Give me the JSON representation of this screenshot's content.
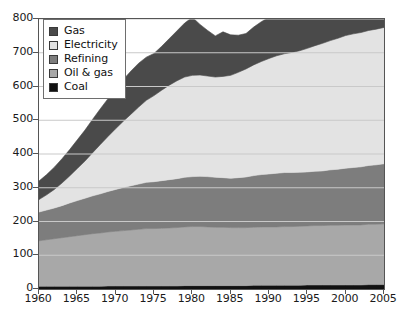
{
  "chart": {
    "type": "area",
    "title": "",
    "legend_position": "top-left",
    "grid": true
  },
  "axes": {
    "x": {
      "label": "",
      "min": 1960,
      "max": 2005,
      "tick_labels": [
        "1960",
        "1965",
        "1970",
        "1975",
        "1980",
        "1985",
        "1990",
        "1995",
        "2000",
        "2005"
      ],
      "tick_values": [
        1960,
        1965,
        1970,
        1975,
        1980,
        1985,
        1990,
        1995,
        2000,
        2005
      ]
    },
    "y": {
      "label": "",
      "min": 0,
      "max": 800,
      "tick_labels": [
        "0",
        "100",
        "200",
        "300",
        "400",
        "500",
        "600",
        "700",
        "800"
      ],
      "tick_values": [
        0,
        100,
        200,
        300,
        400,
        500,
        600,
        700,
        800
      ]
    }
  },
  "legend": {
    "items": [
      {
        "label": "Gas",
        "color": "#4a4a4a"
      },
      {
        "label": "Electricity",
        "color": "#e3e3e3"
      },
      {
        "label": "Refining",
        "color": "#7d7d7d"
      },
      {
        "label": "Oil & gas",
        "color": "#a8a8a8"
      },
      {
        "label": "Coal",
        "color": "#111111"
      }
    ]
  },
  "chart_data": {
    "type": "area",
    "stacked": true,
    "title": "",
    "xlabel": "",
    "ylabel": "",
    "xlim": [
      1960,
      2005
    ],
    "ylim": [
      0,
      800
    ],
    "grid": true,
    "legend_position": "top-left",
    "x": [
      1960,
      1961,
      1962,
      1963,
      1964,
      1965,
      1966,
      1967,
      1968,
      1969,
      1970,
      1971,
      1972,
      1973,
      1974,
      1975,
      1976,
      1977,
      1978,
      1979,
      1980,
      1981,
      1982,
      1983,
      1984,
      1985,
      1986,
      1987,
      1988,
      1989,
      1990,
      1991,
      1992,
      1993,
      1994,
      1995,
      1996,
      1997,
      1998,
      1999,
      2000,
      2001,
      2002,
      2003,
      2004,
      2005
    ],
    "stack_order_bottom_to_top": [
      "Coal",
      "Oil & gas",
      "Refining",
      "Electricity",
      "Gas"
    ],
    "series": [
      {
        "name": "Coal",
        "color": "#111111",
        "values": [
          8,
          8,
          8,
          8,
          8,
          8,
          8,
          8,
          8,
          9,
          9,
          9,
          9,
          9,
          9,
          9,
          9,
          9,
          9,
          10,
          10,
          10,
          10,
          10,
          10,
          10,
          10,
          10,
          11,
          11,
          11,
          11,
          11,
          11,
          11,
          12,
          12,
          12,
          12,
          12,
          12,
          12,
          12,
          13,
          13,
          13
        ]
      },
      {
        "name": "Oil & gas",
        "color": "#a8a8a8",
        "values": [
          135,
          138,
          141,
          144,
          147,
          150,
          153,
          156,
          158,
          160,
          162,
          164,
          166,
          168,
          170,
          170,
          171,
          172,
          173,
          174,
          175,
          175,
          174,
          173,
          173,
          172,
          172,
          172,
          172,
          173,
          173,
          173,
          174,
          174,
          175,
          175,
          176,
          176,
          177,
          177,
          178,
          178,
          178,
          179,
          179,
          180
        ]
      },
      {
        "name": "Refining",
        "color": "#7d7d7d",
        "values": [
          85,
          88,
          91,
          95,
          100,
          104,
          108,
          112,
          116,
          120,
          124,
          128,
          131,
          134,
          137,
          139,
          141,
          143,
          145,
          147,
          148,
          149,
          149,
          148,
          147,
          146,
          148,
          150,
          153,
          155,
          157,
          159,
          160,
          160,
          160,
          160,
          161,
          162,
          164,
          166,
          168,
          170,
          172,
          174,
          176,
          178
        ]
      },
      {
        "name": "Electricity",
        "color": "#e3e3e3",
        "values": [
          37,
          45,
          55,
          67,
          80,
          95,
          110,
          128,
          146,
          163,
          180,
          196,
          212,
          228,
          243,
          255,
          268,
          280,
          290,
          297,
          300,
          300,
          298,
          297,
          300,
          305,
          312,
          320,
          328,
          335,
          342,
          348,
          352,
          356,
          360,
          366,
          372,
          378,
          383,
          388,
          393,
          396,
          398,
          400,
          402,
          404
        ]
      },
      {
        "name": "Gas",
        "color": "#4a4a4a",
        "values": [
          55,
          60,
          66,
          72,
          78,
          85,
          92,
          99,
          106,
          112,
          118,
          124,
          128,
          130,
          128,
          125,
          130,
          138,
          148,
          160,
          172,
          150,
          135,
          122,
          132,
          120,
          110,
          105,
          112,
          118,
          122,
          120,
          112,
          118,
          110,
          108,
          118,
          112,
          118,
          125,
          132,
          138,
          142,
          145,
          130,
          120
        ]
      }
    ],
    "totals_by_year": [
      320,
      339,
      361,
      386,
      413,
      442,
      471,
      503,
      534,
      564,
      593,
      621,
      646,
      669,
      687,
      698,
      719,
      742,
      765,
      788,
      805,
      784,
      766,
      750,
      762,
      753,
      752,
      757,
      776,
      792,
      805,
      811,
      809,
      819,
      816,
      821,
      839,
      840,
      854,
      868,
      883,
      894,
      902,
      911,
      900,
      895
    ]
  }
}
